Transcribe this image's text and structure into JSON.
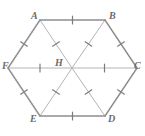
{
  "figure": {
    "name": "regular-hexagon-with-center",
    "shape": "regular hexagon",
    "center_label": "H",
    "stroke_outer_color": "#8d8d8d",
    "stroke_inner_color": "#b4b4b4",
    "tick_color": "#7c7c7c",
    "label_color": "#6b6b6b",
    "background_color": "#ffffff"
  },
  "vertices": [
    {
      "label": "A",
      "x": 40,
      "y": 20,
      "label_x": 31,
      "label_y": 11
    },
    {
      "label": "B",
      "x": 105,
      "y": 20,
      "label_x": 109,
      "label_y": 11
    },
    {
      "label": "C",
      "x": 137,
      "y": 68,
      "label_x": 134,
      "label_y": 61
    },
    {
      "label": "D",
      "x": 105,
      "y": 116,
      "label_x": 108,
      "label_y": 114
    },
    {
      "label": "E",
      "x": 40,
      "y": 116,
      "label_x": 30,
      "label_y": 114
    },
    {
      "label": "F",
      "x": 8,
      "y": 68,
      "label_x": 2,
      "label_y": 61
    }
  ],
  "center": {
    "label": "H",
    "x": 72,
    "y": 68,
    "label_x": 55,
    "label_y": 58
  },
  "sides": [
    {
      "name": "AB",
      "from": "A",
      "to": "B",
      "ticks": 1
    },
    {
      "name": "BC",
      "from": "B",
      "to": "C",
      "ticks": 1
    },
    {
      "name": "CD",
      "from": "C",
      "to": "D",
      "ticks": 1
    },
    {
      "name": "DE",
      "from": "D",
      "to": "E",
      "ticks": 1
    },
    {
      "name": "EF",
      "from": "E",
      "to": "F",
      "ticks": 1
    },
    {
      "name": "FA",
      "from": "F",
      "to": "A",
      "ticks": 1
    }
  ],
  "spokes": [
    {
      "name": "HA",
      "from": "H",
      "to": "A",
      "ticks": 1
    },
    {
      "name": "HB",
      "from": "H",
      "to": "B",
      "ticks": 1
    },
    {
      "name": "HC",
      "from": "H",
      "to": "C",
      "ticks": 1
    },
    {
      "name": "HD",
      "from": "H",
      "to": "D",
      "ticks": 1
    },
    {
      "name": "HE",
      "from": "H",
      "to": "E",
      "ticks": 1
    },
    {
      "name": "HF",
      "from": "H",
      "to": "F",
      "ticks": 1
    }
  ]
}
